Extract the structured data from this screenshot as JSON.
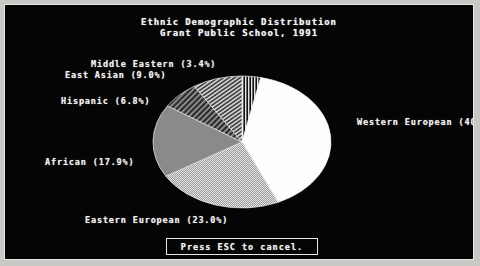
{
  "screen": {
    "background_color": "#050505",
    "border_color": "#e8e8e8",
    "page_background": "#c8c8c4"
  },
  "header": {
    "title_line_1": "Ethnic Demographic Distribution",
    "title_line_2": "Grant Public School, 1991"
  },
  "prompt": {
    "label": "Press ESC to cancel."
  },
  "labels": {
    "middle_eastern": "Middle Eastern (3.4%)",
    "east_asian": "East Asian (9.0%)",
    "hispanic": "Hispanic (6.8%)",
    "african": "African (17.9%)",
    "eastern_european": "Eastern European (23.0%)",
    "western_european": "Western European (40"
  },
  "chart_data": {
    "type": "pie",
    "title": "Ethnic Demographic Distribution\nGrant Public School, 1991",
    "xlabel": "",
    "ylabel": "",
    "legend_position": "callout-labels",
    "grid": false,
    "start_angle_deg": 0,
    "direction": "clockwise",
    "categories": [
      "Middle Eastern",
      "Western European",
      "Eastern European",
      "African",
      "Hispanic",
      "East Asian"
    ],
    "values": [
      3.4,
      40.0,
      23.0,
      17.9,
      6.8,
      9.0
    ],
    "value_unit": "percent",
    "labels": [
      "Middle Eastern (3.4%)",
      "Western European (40",
      "Eastern European (23.0%)",
      "African (17.9%)",
      "Hispanic (6.8%)",
      "East Asian (9.0%)"
    ],
    "slices": [
      {
        "name": "Middle Eastern",
        "value": 3.4,
        "fill": "vertical-hatch",
        "color": "#d8d8d8",
        "label": "Middle Eastern (3.4%)"
      },
      {
        "name": "Western European",
        "value": 40.0,
        "fill": "solid",
        "color": "#fdfdfd",
        "label": "Western European (40"
      },
      {
        "name": "Eastern European",
        "value": 23.0,
        "fill": "fine-stipple",
        "color": "#c2c2c2",
        "label": "Eastern European (23.0%)"
      },
      {
        "name": "African",
        "value": 17.9,
        "fill": "solid-gray",
        "color": "#8a8a8a",
        "label": "African (17.9%)"
      },
      {
        "name": "Hispanic",
        "value": 6.8,
        "fill": "diagonal-hatch",
        "color": "#4a4a4a",
        "label": "Hispanic (6.8%)"
      },
      {
        "name": "East Asian",
        "value": 9.0,
        "fill": "diagonal-hatch-2",
        "color": "#a8a8a8",
        "label": "East Asian (9.0%)"
      }
    ],
    "geometry": {
      "center_x": 237,
      "center_y": 137,
      "radius_x": 89,
      "radius_y": 66
    },
    "note": "Western European label is clipped by the right panel border in the source screenshot."
  }
}
